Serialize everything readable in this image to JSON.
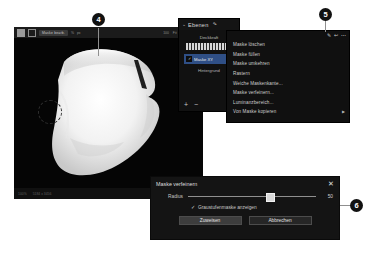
{
  "document": {
    "language": "de",
    "figure_caption": ""
  },
  "editor": {
    "toolbar": {
      "grid_icon": "grid-icon",
      "square_icon": "square-icon",
      "tool_chip_label": "Maske bearb.",
      "mini_labels": [
        "%",
        "px"
      ],
      "right_labels": [
        "100",
        "Fit",
        "1:1",
        "100%"
      ]
    },
    "canvas": {
      "image_description": "Roentgenbild",
      "focus_ring": "focus-ring"
    },
    "status": {
      "left_labels": [
        "100%",
        "5184 x 3456"
      ],
      "right_labels": [
        "RGB",
        "8 Bit"
      ]
    }
  },
  "layers_panel": {
    "title": "Ebenen",
    "edit_icon": "pencil-icon",
    "collapse_icon": "chevron-down-icon",
    "opacity_label": "Deckkraft",
    "layer": {
      "visibility_icon": "checkbox-checked-icon",
      "name": "Maske XY"
    },
    "background_layer": "Hintergrund",
    "footer": {
      "add_label": "+",
      "remove_label": "−"
    }
  },
  "context_menu": {
    "header_icons": [
      "pencil-icon",
      "arrow-icon",
      "more-icon"
    ],
    "items": [
      {
        "label": "Maske löschen",
        "submenu": false
      },
      {
        "label": "Maske füllen",
        "submenu": false
      },
      {
        "label": "Maske umkehren",
        "submenu": false
      },
      {
        "label": "Rastern",
        "submenu": false
      },
      {
        "label": "Weiche Maskenkante...",
        "submenu": false
      },
      {
        "label": "Maske verfeinern...",
        "submenu": false
      },
      {
        "label": "Luminanzbereich...",
        "submenu": false
      },
      {
        "label": "Von Maske kopieren",
        "submenu": true
      }
    ]
  },
  "dialog": {
    "title": "Maske verfeinern",
    "close_icon": "close-icon",
    "radius_label": "Radius",
    "radius_value": "50",
    "radius_percent": 61,
    "checkbox": {
      "checked": true,
      "label": "Graustufenmaske anzeigen"
    },
    "buttons": {
      "apply": "Zuweisen",
      "cancel": "Abbrechen"
    }
  },
  "callouts": [
    {
      "number": "4"
    },
    {
      "number": "5"
    },
    {
      "number": "6"
    }
  ],
  "colors": {
    "panel_bg": "#111111",
    "canvas_bg": "#050505",
    "layer_selected": "#2f4f86",
    "callout_bg": "#111111",
    "leader_line": "#8f8f8f"
  }
}
